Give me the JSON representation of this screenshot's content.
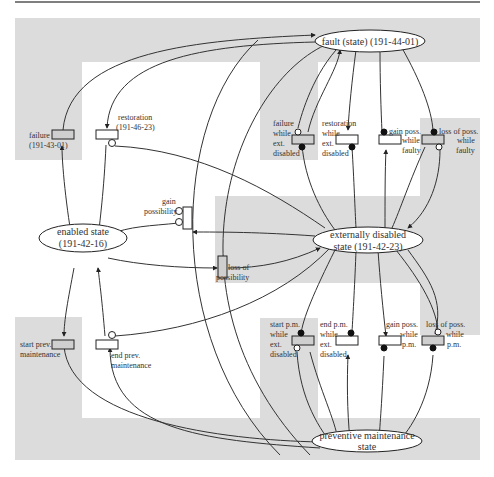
{
  "diagram": {
    "colors": {
      "background": "#ffffff",
      "region": "#dcdcdc",
      "line": "#333333"
    },
    "states": {
      "fault": "fault (state) (191-44-01)",
      "enabled_l1": "enabled state",
      "enabled_l2": "(191-42-16)",
      "extdis_l1": "externally disabled",
      "extdis_l2": "state (191-42-23)",
      "pm_l1": "preventive maintenance",
      "pm_l2": "state"
    },
    "transitions": {
      "failure": [
        "failure",
        "(191-43-01)"
      ],
      "restoration": [
        "restoration",
        "(191-46-23)"
      ],
      "gain_possibility": [
        "gain",
        "possibility"
      ],
      "loss_possibility": [
        "loss of",
        "possibility"
      ],
      "start_pm": [
        "start prev.",
        "maintenance"
      ],
      "end_pm": [
        "end prev.",
        "maintenance"
      ],
      "failure_ext": [
        "failure",
        "while",
        "ext.",
        "disabled"
      ],
      "restoration_ext": [
        "restoration",
        "while",
        "ext.",
        "disabled"
      ],
      "gain_faulty": [
        "gain poss.",
        "while",
        "faulty"
      ],
      "loss_faulty": [
        "loss of poss.",
        "while",
        "faulty"
      ],
      "start_pm_ext": [
        "start p.m.",
        "while",
        "ext.",
        "disabled"
      ],
      "end_pm_ext": [
        "end p.m.",
        "while",
        "ext.",
        "disabled"
      ],
      "gain_pm": [
        "gain poss.",
        "while",
        "p.m."
      ],
      "loss_pm": [
        "loss of poss.",
        "while",
        "p.m."
      ]
    }
  }
}
